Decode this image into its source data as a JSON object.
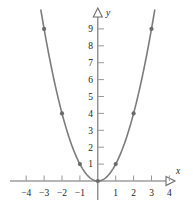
{
  "figure": {
    "name": "parabola-graph",
    "background_color": "#ffffff"
  },
  "chart_data": {
    "type": "line",
    "title": "",
    "subtitle": "",
    "xlabel": "x",
    "ylabel": "y",
    "xlim": [
      -4.8,
      4.8
    ],
    "ylim": [
      -1.1,
      9.9
    ],
    "grid": false,
    "legend": null,
    "annotations": [],
    "x_ticks": [
      -4,
      -3,
      -2,
      -1,
      1,
      2,
      3,
      4
    ],
    "x_tick_labels": [
      "−4",
      "−3",
      "−2",
      "−1",
      "1",
      "2",
      "3",
      "4"
    ],
    "y_ticks": [
      1,
      2,
      3,
      4,
      5,
      6,
      7,
      8,
      9
    ],
    "y_tick_labels": [
      "1",
      "2",
      "3",
      "4",
      "5",
      "6",
      "7",
      "8",
      "9"
    ],
    "series": [
      {
        "name": "y = x squared",
        "kind": "curve",
        "color": "#7c7c7c",
        "line_width": 1.6,
        "marker": "dot",
        "marker_color": "#6b6b6b",
        "x": [
          -3,
          -2,
          -1,
          0,
          1,
          2,
          3
        ],
        "values": [
          9,
          4,
          1,
          0,
          1,
          4,
          9
        ],
        "marked_points": [
          {
            "x": -3,
            "y": 9
          },
          {
            "x": -2,
            "y": 4
          },
          {
            "x": -1,
            "y": 1
          },
          {
            "x": 0,
            "y": 0
          },
          {
            "x": 1,
            "y": 1
          },
          {
            "x": 2,
            "y": 4
          },
          {
            "x": 3,
            "y": 9
          }
        ]
      }
    ],
    "axis_style": {
      "color": "#6e6e6e",
      "tick_color": "#9a9a9a",
      "arrowhead": "open-triangle",
      "x_axis_arrow": "right",
      "y_axis_arrow": "up"
    }
  }
}
